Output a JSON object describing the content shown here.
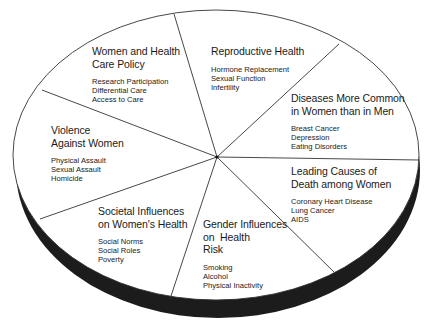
{
  "diagram": {
    "type": "pie-disc",
    "colors": {
      "background": "#ffffff",
      "face": "#ffffff",
      "outline": "#333333",
      "rim": "#1c1c1c",
      "text": "#1a1a1a"
    },
    "segments": [
      {
        "title": "Women and Health Care Policy",
        "title_lines": [
          "Women and Health",
          "Care Policy"
        ],
        "items": [
          "Research Participation",
          "Differential Care",
          "Access to Care"
        ]
      },
      {
        "title": "Reproductive Health",
        "title_lines": [
          "Reproductive Health"
        ],
        "items": [
          "Hormone Replacement",
          "Sexual Function",
          "Infertility"
        ]
      },
      {
        "title": "Diseases More Common in Women than in Men",
        "title_lines": [
          "Diseases More Common",
          "in Women than in Men"
        ],
        "items": [
          "Breast Cancer",
          "Depression",
          "Eating Disorders"
        ]
      },
      {
        "title": "Leading Causes of Death among Women",
        "title_lines": [
          "Leading Causes of",
          "Death among Women"
        ],
        "items": [
          "Coronary Heart Disease",
          "Lung Cancer",
          "AIDS"
        ]
      },
      {
        "title": "Gender Influences on Health Risk",
        "title_lines": [
          "Gender Influences",
          "on  Health",
          "Risk"
        ],
        "items": [
          "Smoking",
          "Alcohol",
          "Physical Inactivity"
        ]
      },
      {
        "title": "Societal Influences on Women's Health",
        "title_lines": [
          "Societal Influences",
          "on Women's Health"
        ],
        "items": [
          "Social Norms",
          "Social Roles",
          "Poverty"
        ]
      },
      {
        "title": "Violence Against Women",
        "title_lines": [
          "Violence",
          "Against Women"
        ],
        "items": [
          "Physical Assault",
          "Sexual Assault",
          "Homicide"
        ]
      }
    ]
  }
}
